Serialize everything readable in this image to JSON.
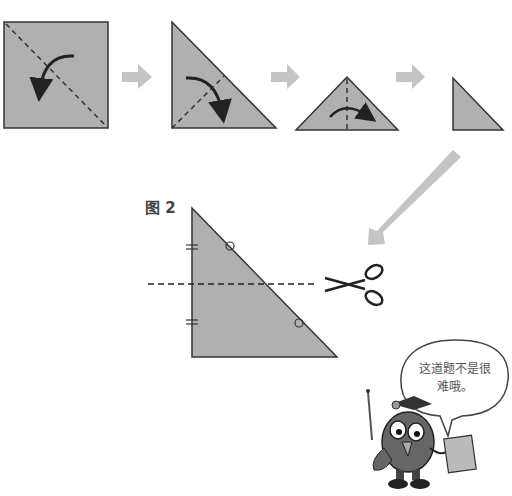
{
  "figure2": {
    "label": "图 2"
  },
  "speech_bubble": {
    "line1": "这道题不是很",
    "line2": "难哦。"
  },
  "colors": {
    "paper": "#b0b0b0",
    "arrow": "#c4c4c4",
    "outline": "#333333"
  },
  "steps": [
    {
      "shape": "square",
      "fold_line": "diagonal"
    },
    {
      "shape": "right-triangle",
      "fold_line": "altitude"
    },
    {
      "shape": "isosceles-triangle",
      "fold_line": "vertical-center"
    },
    {
      "shape": "small-right-triangle"
    }
  ]
}
